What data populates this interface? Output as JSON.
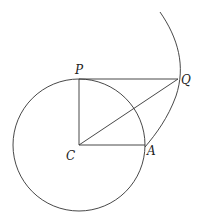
{
  "diagram": {
    "labels": {
      "P": "P",
      "Q": "Q",
      "C": "C",
      "A": "A"
    },
    "colors": {
      "stroke": "#333333",
      "text": "#222222",
      "background": "#ffffff"
    }
  }
}
